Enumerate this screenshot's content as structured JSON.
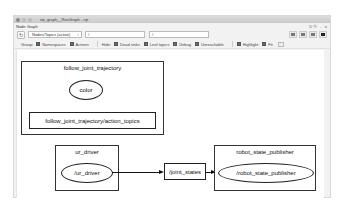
{
  "window": {
    "title": "rqt_graph__RosGraph - rqt",
    "plugin_title": "Node Graph",
    "plugin_controls": "D⓪ -  o"
  },
  "toolbar": {
    "refresh_icon": "refresh-icon",
    "graph_type": "Nodes/Topics (active)",
    "node_filter": "/",
    "topic_filter": "/",
    "icons": [
      "load-dot-icon",
      "save-dot-icon",
      "save-svg-icon",
      "save-image-icon"
    ]
  },
  "options": {
    "group_label": "Group:",
    "namespaces": "Namespaces",
    "actions": "Actions",
    "hide_label": "Hide:",
    "dead_sinks": "Dead sinks",
    "leaf_topics": "Leaf topics",
    "debug": "Debug",
    "unreachable": "Unreachable",
    "highlight": "Highlight",
    "fit": "Fit"
  },
  "graph": {
    "clusters": [
      {
        "id": "follow_joint_trajectory",
        "label": "follow_joint_trajectory"
      },
      {
        "id": "ur_driver",
        "label": "ur_driver"
      },
      {
        "id": "robot_state_publisher",
        "label": "robot_state_publisher"
      }
    ],
    "nodes": {
      "color": "color",
      "action_topics": "follow_joint_trajectory/action_topics",
      "ur_driver": "/ur_driver",
      "joint_states": "/joint_states",
      "robot_state_publisher": "/robot_state_publisher"
    },
    "edges": [
      {
        "from": "/ur_driver",
        "to": "/joint_states"
      },
      {
        "from": "/joint_states",
        "to": "/robot_state_publisher"
      }
    ]
  }
}
